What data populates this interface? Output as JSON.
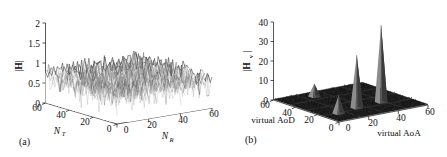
{
  "figure": {
    "background": "#ffffff",
    "ink": "#111111",
    "panels": [
      "(a)",
      "(b)"
    ]
  },
  "panel_a": {
    "tag": "(a)",
    "zlabel": "|H|",
    "xlabel": "N_R",
    "xlabel_base": "N",
    "xlabel_sub": "R",
    "ylabel": "N_T",
    "ylabel_base": "N",
    "ylabel_sub": "T",
    "z_ticks": [
      "2",
      "1.5",
      "1",
      "0.5",
      "0"
    ],
    "y_ticks": [
      "60",
      "40",
      "20",
      "0"
    ],
    "x_ticks": [
      "0",
      "20",
      "40",
      "60"
    ]
  },
  "panel_b": {
    "tag": "(b)",
    "zlabel": "|H_v|",
    "zlabel_base": "|H",
    "zlabel_sub": "v",
    "zlabel_tail": "|",
    "xlabel": "virtual AoA",
    "ylabel": "virtual AoD",
    "z_ticks": [
      "40",
      "30",
      "20",
      "10",
      "0"
    ],
    "y_ticks": [
      "60",
      "40",
      "20",
      "0"
    ],
    "x_ticks": [
      "0",
      "20",
      "40",
      "60"
    ]
  },
  "chart_data": [
    {
      "type": "surface",
      "title": "(a)",
      "xlabel": "N_R",
      "ylabel": "N_T",
      "zlabel": "|H|",
      "xlim": [
        0,
        64
      ],
      "ylim": [
        0,
        64
      ],
      "zlim": [
        0,
        2
      ],
      "x_ticks": [
        0,
        20,
        40,
        60
      ],
      "y_ticks": [
        0,
        20,
        40,
        60
      ],
      "z_ticks": [
        0,
        0.5,
        1,
        1.5,
        2
      ],
      "grid": true,
      "description": "Dense i.i.d. Rayleigh MIMO channel magnitude surface; values fluctuate randomly about a mean near 0.9 spanning roughly 0 to 2 across the whole 64x64 grid, with no sparse structure.",
      "mean": 0.9,
      "max": 2.0,
      "min": 0.0,
      "grid_size": [
        64,
        64
      ]
    },
    {
      "type": "surface",
      "title": "(b)",
      "xlabel": "virtual AoA",
      "ylabel": "virtual AoD",
      "zlabel": "|H_v|",
      "xlim": [
        0,
        64
      ],
      "ylim": [
        0,
        64
      ],
      "zlim": [
        0,
        45
      ],
      "x_ticks": [
        0,
        20,
        40,
        60
      ],
      "y_ticks": [
        0,
        20,
        40,
        60
      ],
      "z_ticks": [
        0,
        10,
        20,
        30,
        40
      ],
      "grid": true,
      "description": "Sparse virtual (beamspace) channel representation: flat near-zero floor with four isolated spikes.",
      "floor_level": 0.5,
      "peaks": [
        {
          "virtual_AoA": 10,
          "virtual_AoD": 50,
          "value": 11
        },
        {
          "virtual_AoA": 26,
          "virtual_AoD": 46,
          "value": 31
        },
        {
          "virtual_AoA": 45,
          "virtual_AoD": 44,
          "value": 45
        },
        {
          "virtual_AoA": 22,
          "virtual_AoD": 10,
          "value": 8
        }
      ]
    }
  ]
}
